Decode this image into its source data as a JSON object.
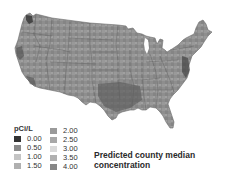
{
  "map": {
    "subject": "Radon in contiguous United States",
    "fill_base": "#8f8f8f",
    "state_border_color": "#555555",
    "hotspots": [
      {
        "region": "pacific-northwest-coast",
        "color": "#3a3a3a"
      },
      {
        "region": "northern-california-coast",
        "color": "#555555"
      },
      {
        "region": "southern-california",
        "color": "#5a5a5a"
      },
      {
        "region": "gulf-coast",
        "color": "#646464"
      },
      {
        "region": "mid-atlantic-coast",
        "color": "#4a4a4a"
      }
    ]
  },
  "legend": {
    "title": "pCi/L",
    "items": [
      {
        "label": "0.00",
        "color": "#333333"
      },
      {
        "label": "0.50",
        "color": "#8a8a8a"
      },
      {
        "label": "1.00",
        "color": "#c4c4c4"
      },
      {
        "label": "1.50",
        "color": "#b0b0b0"
      },
      {
        "label": "2.00",
        "color": "#9a9a9a"
      },
      {
        "label": "2.50",
        "color": "#a8a8a8"
      },
      {
        "label": "3.00",
        "color": "#dadada"
      },
      {
        "label": "3.50",
        "color": "#b0b0b0"
      },
      {
        "label": "4.00",
        "color": "#878787"
      }
    ]
  },
  "caption": {
    "line1": "Predicted county median",
    "line2": "concentration"
  }
}
